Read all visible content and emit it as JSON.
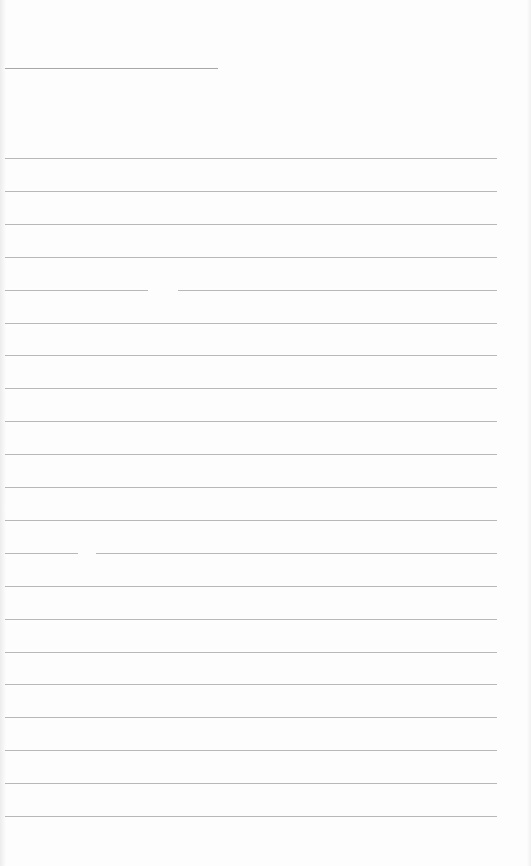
{
  "page": {
    "type": "blank lined paper",
    "background_color": "#fdfdfd",
    "line_color": "#b8b8b8"
  },
  "title_line": {
    "x": 5,
    "y": 68,
    "width": 213
  },
  "rules": {
    "count": 21,
    "start_y": 158,
    "spacing": 32.9,
    "x_start": 5,
    "x_end": 497
  },
  "gaps": [
    {
      "line_index": 4,
      "x": 148,
      "width": 30
    },
    {
      "line_index": 12,
      "x": 78,
      "width": 18
    }
  ]
}
